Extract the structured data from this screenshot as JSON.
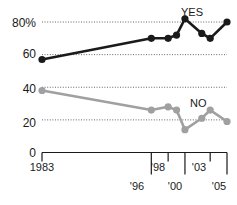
{
  "chart_data": {
    "type": "line",
    "title": "",
    "subtitle": "",
    "xlabel": "",
    "ylabel": "",
    "ylim": [
      0,
      90
    ],
    "xlim": [
      1983,
      2005
    ],
    "grid": true,
    "gridlines": [
      20,
      40,
      60,
      80
    ],
    "legend_position": "inline-annotation",
    "y_ticks": [
      {
        "value": 80,
        "label": "80%"
      },
      {
        "value": 60,
        "label": "60"
      },
      {
        "value": 40,
        "label": "40"
      },
      {
        "value": 20,
        "label": "20"
      },
      {
        "value": 0,
        "label": "0"
      }
    ],
    "x_ticks": [
      {
        "value": 1983,
        "label": "1983",
        "row": 0
      },
      {
        "value": 1996,
        "label": "'96",
        "row": 1
      },
      {
        "value": 1998,
        "label": "'98",
        "row": 0
      },
      {
        "value": 2000,
        "label": "'00",
        "row": 1
      },
      {
        "value": 2003,
        "label": "'03",
        "row": 0
      },
      {
        "value": 2005,
        "label": "'05",
        "row": 1
      }
    ],
    "series": [
      {
        "name": "YES",
        "color": "#1a1a1a",
        "label": "YES",
        "x": [
          1983,
          1996,
          1998,
          1999,
          2000,
          2002,
          2003,
          2005
        ],
        "values": [
          57,
          70,
          70,
          72,
          82,
          73,
          70,
          80
        ]
      },
      {
        "name": "NO",
        "color": "#a0a0a0",
        "label": "NO",
        "x": [
          1983,
          1996,
          1998,
          1999,
          2000,
          2002,
          2003,
          2005
        ],
        "values": [
          38,
          26,
          28,
          26,
          14,
          21,
          26,
          19
        ]
      }
    ]
  },
  "annotations": {
    "yes_label": "YES",
    "no_label": "NO"
  }
}
